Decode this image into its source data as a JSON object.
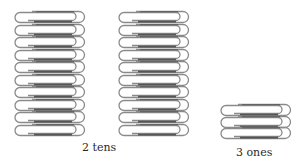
{
  "groups": [
    {
      "id": "tens-1",
      "count": 10,
      "x": 12,
      "y": 10,
      "pitch": 12.5
    },
    {
      "id": "tens-2",
      "count": 10,
      "x": 116,
      "y": 10,
      "pitch": 12.5
    },
    {
      "id": "ones",
      "count": 3,
      "x": 218,
      "y": 103,
      "pitch": 11.5
    }
  ],
  "labels": {
    "tens": "2 tens",
    "ones": "3 ones"
  },
  "colors": {
    "wire": "#8a8a8a",
    "wire_dark": "#555555",
    "highlight": "#cfcfcf"
  }
}
